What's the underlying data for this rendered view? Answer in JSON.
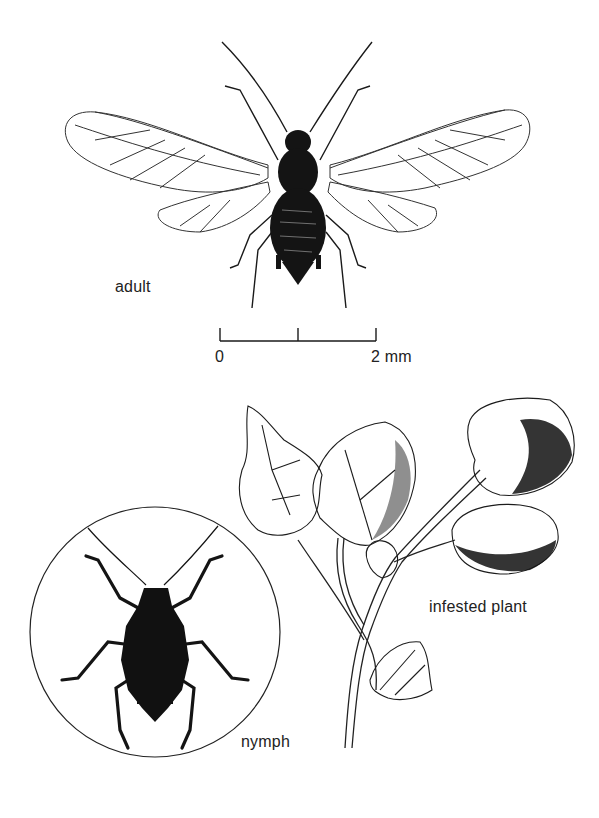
{
  "figure": {
    "labels": {
      "adult": "adult",
      "nymph": "nymph",
      "infested_plant": "infested plant"
    },
    "scale_bar": {
      "start_label": "0",
      "end_label": "2 mm",
      "ticks": 3
    },
    "colors": {
      "ink": "#1a1a1a",
      "background": "#ffffff"
    }
  }
}
